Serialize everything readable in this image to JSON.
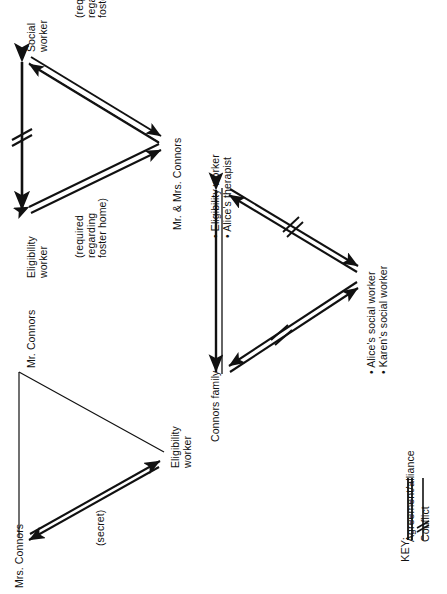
{
  "document": {
    "type": "relationship-triangles-diagram",
    "orientation": "rotated-90-ccw",
    "background": "#ffffff",
    "ink": "#000000"
  },
  "triangles": [
    {
      "id": "top-triangle",
      "nodes": [
        {
          "id": "social-worker",
          "label": "Social\nworker"
        },
        {
          "id": "eligibility-worker",
          "label": "Eligibility\nworker"
        },
        {
          "id": "connors-couple",
          "label": "Mr. & Mrs. Connors"
        }
      ],
      "edges": [
        {
          "from": "social-worker",
          "to": "eligibility-worker",
          "type": "conflict",
          "style": "double-headed-arrow-with-hash"
        },
        {
          "from": "social-worker",
          "to": "connors-couple",
          "type": "agreement",
          "style": "double-line-double-headed-arrow",
          "annotation": "(required\nregarding\nfoster home)"
        },
        {
          "from": "eligibility-worker",
          "to": "connors-couple",
          "type": "agreement",
          "style": "double-line-double-headed-arrow",
          "annotation": "(required\nregarding\nfoster home)"
        }
      ]
    },
    {
      "id": "bottom-left-triangle",
      "nodes": [
        {
          "id": "mr-connors",
          "label": "Mr. Connors"
        },
        {
          "id": "mrs-connors",
          "label": "Mrs. Connors"
        },
        {
          "id": "eligibility-worker-2",
          "label": "Eligibility\nworker"
        }
      ],
      "edges": [
        {
          "from": "mr-connors",
          "to": "mrs-connors",
          "type": "plain",
          "style": "single-thin-line"
        },
        {
          "from": "mr-connors",
          "to": "eligibility-worker-2",
          "type": "plain",
          "style": "single-thin-line"
        },
        {
          "from": "mrs-connors",
          "to": "eligibility-worker-2",
          "type": "agreement",
          "style": "double-line-double-headed-arrow",
          "annotation": "(secret)"
        }
      ]
    },
    {
      "id": "middle-right-triangle",
      "nodes": [
        {
          "id": "eligibility-worker-therapist",
          "label": "• Eligibility worker\n• Alice's therapist"
        },
        {
          "id": "connors-family",
          "label": "Connors family"
        },
        {
          "id": "social-workers",
          "label": "• Alice's social worker\n• Karen's social worker"
        }
      ],
      "edges": [
        {
          "from": "connors-family",
          "to": "eligibility-worker-therapist",
          "type": "agreement",
          "style": "double-line-double-headed-arrow"
        },
        {
          "from": "eligibility-worker-therapist",
          "to": "social-workers",
          "type": "conflict",
          "style": "double-headed-arrow-with-hash"
        },
        {
          "from": "connors-family",
          "to": "social-workers",
          "type": "conflict",
          "style": "double-headed-arrow-with-hash"
        }
      ]
    }
  ],
  "labels": {
    "social_worker": "Social\nworker",
    "eligibility_worker_top": "Eligibility\nworker",
    "connors_couple": "Mr. & Mrs. Connors",
    "required_foster_home_upper": "(required\nregarding\nfoster home)",
    "required_foster_home_lower": "(required\nregarding\nfoster home)",
    "mr_connors": "Mr. Connors",
    "mrs_connors": "Mrs. Connors",
    "eligibility_worker_bottom": "Eligibility\nworker",
    "secret": "(secret)",
    "eligibility_worker_bullet": "• Eligibility worker",
    "alices_therapist_bullet": "• Alice's therapist",
    "connors_family": "Connors family",
    "alices_social_worker_bullet": "• Alice's social worker",
    "karens_social_worker_bullet": "• Karen's social worker"
  },
  "key": {
    "title": "KEY:",
    "entries": [
      {
        "id": "agreement",
        "label": "Agreement/alliance",
        "symbol": "double-parallel-lines"
      },
      {
        "id": "conflict",
        "label": "Conflict",
        "symbol": "line-with-hash-slash"
      }
    ]
  }
}
